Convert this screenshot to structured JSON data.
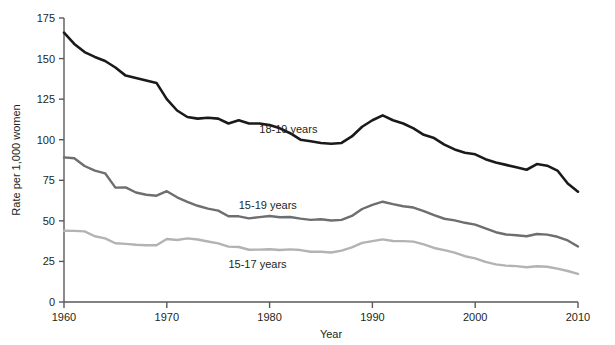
{
  "figure": {
    "credit": "Courtesy of CDC/NCHS, National Vital Statistics System"
  },
  "chart_data": {
    "type": "line",
    "title": "",
    "xlabel": "Year",
    "ylabel": "Rate per 1,000 women",
    "xlim": [
      1960,
      2010
    ],
    "ylim": [
      0,
      175
    ],
    "grid": false,
    "legend_position": "inline-annotations",
    "xticks": [
      1960,
      1970,
      1980,
      1990,
      2000,
      2010
    ],
    "xticklabels": [
      "1960",
      "1970",
      "1980",
      "1990",
      "2000",
      "2010"
    ],
    "yticks": [
      0,
      25,
      50,
      75,
      100,
      125,
      150,
      175
    ],
    "yticklabels": [
      "0",
      "25",
      "50",
      "75",
      "100",
      "125",
      "150",
      "175"
    ],
    "x": [
      1960,
      1961,
      1962,
      1963,
      1964,
      1965,
      1966,
      1967,
      1968,
      1969,
      1970,
      1971,
      1972,
      1973,
      1974,
      1975,
      1976,
      1977,
      1978,
      1979,
      1980,
      1981,
      1982,
      1983,
      1984,
      1985,
      1986,
      1987,
      1988,
      1989,
      1990,
      1991,
      1992,
      1993,
      1994,
      1995,
      1996,
      1997,
      1998,
      1999,
      2000,
      2001,
      2002,
      2003,
      2004,
      2005,
      2006,
      2007,
      2008,
      2009,
      2010
    ],
    "series": [
      {
        "name": "18-19 years",
        "color": "#1a1a1a",
        "linewidth": 2.6,
        "label_x": 1979,
        "label_y": 104,
        "values": [
          166.0,
          159.0,
          154.0,
          151.0,
          148.5,
          144.5,
          139.5,
          138.0,
          136.5,
          135.0,
          125.0,
          118.0,
          114.0,
          113.0,
          113.5,
          113.0,
          110.0,
          112.0,
          110.0,
          110.0,
          109.0,
          107.0,
          104.0,
          100.0,
          99.0,
          98.0,
          97.5,
          98.0,
          102.0,
          108.0,
          112.0,
          115.0,
          112.0,
          110.0,
          107.0,
          103.0,
          101.0,
          97.0,
          94.0,
          92.0,
          91.0,
          88.0,
          86.0,
          84.5,
          83.0,
          81.5,
          85.0,
          84.0,
          81.0,
          73.0,
          68.0
        ]
      },
      {
        "name": "15-19 years",
        "color": "#6d6e71",
        "linewidth": 2.4,
        "label_x": 1977,
        "label_y": 57,
        "values": [
          89.1,
          88.6,
          83.8,
          80.9,
          79.3,
          70.5,
          70.6,
          67.5,
          66.1,
          65.5,
          68.3,
          64.5,
          61.7,
          59.3,
          57.5,
          56.3,
          52.8,
          52.8,
          51.5,
          52.3,
          53.0,
          52.2,
          52.4,
          51.4,
          50.6,
          51.0,
          50.2,
          50.6,
          53.0,
          57.3,
          59.9,
          61.8,
          60.3,
          59.0,
          58.2,
          56.0,
          53.5,
          51.3,
          50.3,
          48.8,
          47.7,
          45.3,
          43.0,
          41.6,
          41.1,
          40.5,
          41.9,
          41.5,
          40.2,
          37.9,
          34.2
        ]
      },
      {
        "name": "15-17 years",
        "color": "#b3b3b3",
        "linewidth": 2.4,
        "label_x": 1976,
        "label_y": 21,
        "values": [
          43.9,
          43.8,
          43.5,
          40.5,
          39.2,
          36.2,
          35.8,
          35.3,
          35.0,
          35.0,
          38.8,
          38.2,
          39.2,
          38.5,
          37.3,
          36.1,
          34.1,
          33.9,
          32.2,
          32.3,
          32.5,
          32.0,
          32.4,
          32.0,
          31.0,
          31.0,
          30.5,
          31.7,
          33.6,
          36.4,
          37.5,
          38.6,
          37.6,
          37.5,
          37.2,
          35.5,
          33.3,
          32.0,
          30.4,
          28.2,
          26.9,
          24.7,
          23.2,
          22.4,
          22.1,
          21.4,
          22.0,
          21.7,
          20.6,
          19.1,
          17.3
        ]
      }
    ]
  }
}
